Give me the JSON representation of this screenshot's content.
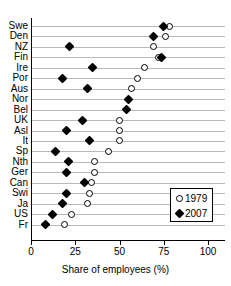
{
  "chart_data": {
    "type": "scatter",
    "title": "",
    "xlabel": "Share of employees (%)",
    "ylabel": "",
    "xlim": [
      0,
      100
    ],
    "xticks": [
      0,
      25,
      50,
      75,
      100
    ],
    "xtick_labels": [
      "0",
      "25",
      "50",
      "75",
      "100"
    ],
    "grid": true,
    "grid_axis": "y",
    "legend_position": "bottom-right",
    "categories": [
      "Swe",
      "Den",
      "NZ",
      "Fin",
      "Ire",
      "Por",
      "Aus",
      "Nor",
      "Bel",
      "UK",
      "Asl",
      "It",
      "Sp",
      "Nth",
      "Ger",
      "Can",
      "Swi",
      "Ja",
      "US",
      "Fr"
    ],
    "series": [
      {
        "name": "1979",
        "marker": "open-circle",
        "color": "#000000",
        "values": [
          78,
          76,
          69,
          72,
          64,
          60,
          57,
          null,
          null,
          50,
          50,
          50,
          44,
          36,
          36,
          34,
          33,
          32,
          23,
          19
        ]
      },
      {
        "name": "2007",
        "marker": "filled-diamond",
        "color": "#000000",
        "values": [
          75,
          69,
          22,
          74,
          35,
          18,
          32,
          55,
          54,
          29,
          20,
          33,
          14,
          21,
          20,
          30,
          20,
          18,
          12,
          8
        ]
      }
    ]
  },
  "axis": {
    "x_title": "Share of employees (%)",
    "tick_labels": [
      "0",
      "25",
      "50",
      "75",
      "100"
    ],
    "category_labels": [
      "Swe",
      "Den",
      "NZ",
      "Fin",
      "Ire",
      "Por",
      "Aus",
      "Nor",
      "Bel",
      "UK",
      "Asl",
      "It",
      "Sp",
      "Nth",
      "Ger",
      "Can",
      "Swi",
      "Ja",
      "US",
      "Fr"
    ]
  },
  "legend": {
    "entries": [
      {
        "label": "1979",
        "marker": "open-circle-icon"
      },
      {
        "label": "2007",
        "marker": "filled-diamond-icon"
      }
    ]
  }
}
